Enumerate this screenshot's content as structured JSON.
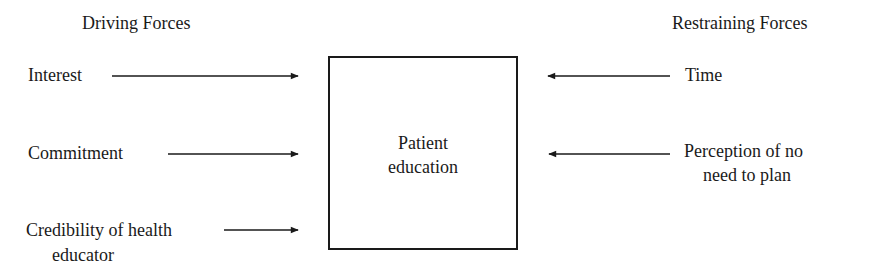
{
  "headers": {
    "driving": "Driving Forces",
    "restraining": "Restraining Forces"
  },
  "center": {
    "line1": "Patient",
    "line2": "education"
  },
  "driving_forces": [
    {
      "line1": "Interest"
    },
    {
      "line1": "Commitment"
    },
    {
      "line1": "Credibility of health",
      "line2": "educator"
    }
  ],
  "restraining_forces": [
    {
      "line1": "Time"
    },
    {
      "line1": "Perception of no",
      "line2": "need to plan"
    }
  ]
}
